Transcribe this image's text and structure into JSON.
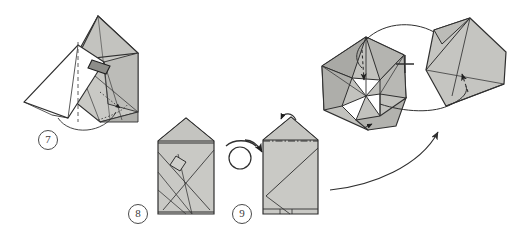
{
  "figure": {
    "kind": "origami-instruction-diagram",
    "background_color": "#ffffff",
    "paper_fill_light": "#c9c9c5",
    "paper_fill_mid": "#b4b4b0",
    "paper_fill_dark": "#9a9a96",
    "paper_fill_white": "#ffffff",
    "line_color": "#2f2f2f",
    "width": 511,
    "height": 233
  },
  "steps": [
    {
      "id": "step-7",
      "label": "7",
      "label_x": 38,
      "label_y": 130,
      "description": "Folded unit shown rotated, with a large white flap folded over to the left and a dashed valley-fold line running vertically; a dotted line with a small arrowhead indicates a hidden fold on the lower right, and a curved arrow wraps around the bottom edge."
    },
    {
      "id": "step-8",
      "label": "8",
      "label_x": 128,
      "label_y": 206,
      "description": "Completed pentagon-house shaped module seen from the front, showing criss-crossing diagonal crease lines and a small square pocket near the centre."
    },
    {
      "id": "step-9",
      "label": "9",
      "label_x": 251,
      "label_y": 206,
      "description": "The same module after turning it over; a small arrow at the top points to the peak flap and a dash-dot line marks the horizontal fold."
    }
  ],
  "symbols": [
    {
      "id": "turn-over-symbol",
      "name": "turn-over-icon",
      "description": "Circular loop arrow meaning turn the model over",
      "x": 238,
      "y": 152
    },
    {
      "id": "plus-symbol",
      "name": "plus-icon",
      "label": "+",
      "description": "Plus sign joining the two modules in the assembly illustration",
      "x": 404,
      "y": 64
    },
    {
      "id": "assembly-arrow",
      "name": "assembly-arrow-icon",
      "description": "Long sweeping curved arrow from step 9 up to the assembly illustration"
    },
    {
      "id": "insert-arrow-left",
      "name": "insert-arrow-icon",
      "description": "Curved arrow with dashed tail pointing down into the pocket of the left module"
    },
    {
      "id": "insert-arrow-right",
      "name": "insert-arrow-icon",
      "description": "Curved arrow with dashed tail pointing into the right module"
    }
  ],
  "assembly": {
    "id": "assembly-illustration",
    "description": "Two finished modules drawn in three-quarter view being joined together; the left open module has white interior pockets and the right module is a shaded flat unit.",
    "left_module_name": "open-module",
    "right_module_name": "flat-module"
  }
}
